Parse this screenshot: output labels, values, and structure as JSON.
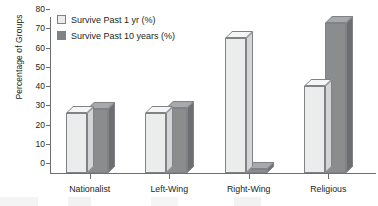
{
  "chart_data": {
    "type": "bar",
    "title": "",
    "xlabel": "",
    "ylabel": "Percentage of Groups",
    "categories": [
      "Nationalist",
      "Left-Wing",
      "Right-Wing",
      "Religious"
    ],
    "series": [
      {
        "name": "Survive Past 1 yr (%)",
        "values": [
          31,
          31,
          70,
          45
        ]
      },
      {
        "name": "Survive Past 10 years (%)",
        "values": [
          33,
          34,
          2,
          78
        ]
      }
    ],
    "ylim": [
      0,
      80
    ],
    "yticks": [
      0,
      10,
      20,
      30,
      40,
      50,
      60,
      70,
      80
    ],
    "grid": false,
    "legend_position": "top-left",
    "colors": {
      "series1_fill": "#ebecec",
      "series1_top": "#f4f5f5",
      "series1_side": "#d4d5d6",
      "series2_fill": "#8a8c8e",
      "series2_top": "#a7a9ac",
      "series2_side": "#6d6e71",
      "axis": "#6d6e71",
      "text": "#231f20"
    }
  }
}
